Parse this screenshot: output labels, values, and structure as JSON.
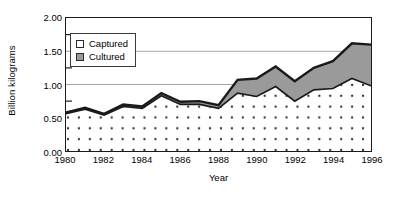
{
  "chart_data": {
    "type": "area",
    "title": "",
    "xlabel": "Year",
    "ylabel": "Billion kilograms",
    "stacked": true,
    "grid": "horizontal",
    "legend_position": "upper-left-inside",
    "xlim": [
      1980,
      1996
    ],
    "ylim": [
      0.0,
      2.0
    ],
    "yticks": [
      "0.00",
      "0.50",
      "1.00",
      "1.50",
      "2.00"
    ],
    "ytick_values": [
      0.0,
      0.5,
      1.0,
      1.5,
      2.0
    ],
    "y_minor_ticks": [
      0.25,
      0.75,
      1.25,
      1.75
    ],
    "xticks": [
      "1980",
      "1982",
      "1984",
      "1986",
      "1988",
      "1990",
      "1992",
      "1994",
      "1996"
    ],
    "xtick_values": [
      1980,
      1982,
      1984,
      1986,
      1988,
      1990,
      1992,
      1994,
      1996
    ],
    "x": [
      1980,
      1981,
      1982,
      1983,
      1984,
      1985,
      1986,
      1987,
      1988,
      1989,
      1990,
      1991,
      1992,
      1993,
      1994,
      1995,
      1996
    ],
    "categories": [
      "1980",
      "1981",
      "1982",
      "1983",
      "1984",
      "1985",
      "1986",
      "1987",
      "1988",
      "1989",
      "1990",
      "1991",
      "1992",
      "1993",
      "1994",
      "1995",
      "1996"
    ],
    "series": [
      {
        "name": "Captured",
        "color": "#ffffff",
        "pattern": "dotted",
        "values": [
          0.56,
          0.63,
          0.54,
          0.67,
          0.64,
          0.83,
          0.7,
          0.7,
          0.64,
          0.87,
          0.82,
          0.97,
          0.75,
          0.92,
          0.94,
          1.09,
          0.98
        ]
      },
      {
        "name": "Cultured",
        "color": "#9a9a9a",
        "pattern": "solid-gray",
        "values": [
          0.02,
          0.02,
          0.02,
          0.03,
          0.03,
          0.04,
          0.04,
          0.05,
          0.05,
          0.2,
          0.27,
          0.3,
          0.3,
          0.33,
          0.41,
          0.53,
          0.62
        ]
      }
    ],
    "totals": [
      0.58,
      0.65,
      0.56,
      0.7,
      0.67,
      0.87,
      0.74,
      0.75,
      0.69,
      1.07,
      1.09,
      1.27,
      1.05,
      1.25,
      1.35,
      1.62,
      1.6
    ]
  },
  "legend": {
    "items": [
      {
        "label": "Captured",
        "swatch": "captured-swatch"
      },
      {
        "label": "Cultured",
        "swatch": "cultured-swatch"
      }
    ]
  },
  "axes": {
    "y_title": "Billion kilograms",
    "x_title": "Year"
  },
  "colors": {
    "axis": "#1a1a1a",
    "grid": "#9a9a9a",
    "captured_fill": "#ffffff",
    "cultured_fill": "#9a9a9a",
    "line": "#1a1a1a",
    "background": "#ffffff"
  }
}
